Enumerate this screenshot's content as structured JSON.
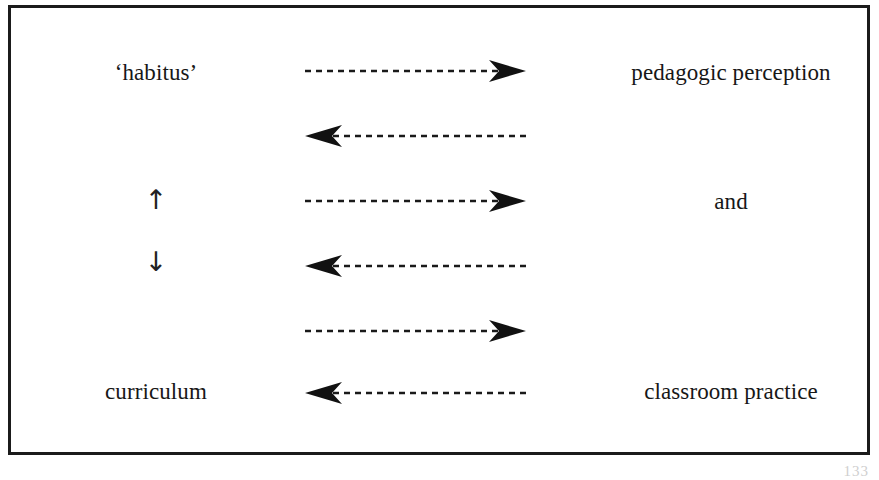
{
  "diagram": {
    "frame": {
      "border_color": "#1b1b1b",
      "background_color": "#ffffff"
    },
    "left_column": {
      "top_label": "‘habitus’",
      "up_arrow_glyph": "↑",
      "down_arrow_glyph": "↓",
      "bottom_label": "curriculum"
    },
    "right_column": {
      "top_label": "pedagogic perception",
      "middle_label": "and",
      "bottom_label": "classroom practice"
    },
    "connectors": [
      {
        "name": "connector-1",
        "direction": "right",
        "style": "dashed",
        "color": "#1a1a1a"
      },
      {
        "name": "connector-2",
        "direction": "left",
        "style": "dashed",
        "color": "#1a1a1a"
      },
      {
        "name": "connector-3",
        "direction": "right",
        "style": "dashed",
        "color": "#1a1a1a"
      },
      {
        "name": "connector-4",
        "direction": "left",
        "style": "dashed",
        "color": "#1a1a1a"
      },
      {
        "name": "connector-5",
        "direction": "right",
        "style": "dashed",
        "color": "#1a1a1a"
      },
      {
        "name": "connector-6",
        "direction": "left",
        "style": "dashed",
        "color": "#1a1a1a"
      }
    ],
    "page_number": "133"
  }
}
